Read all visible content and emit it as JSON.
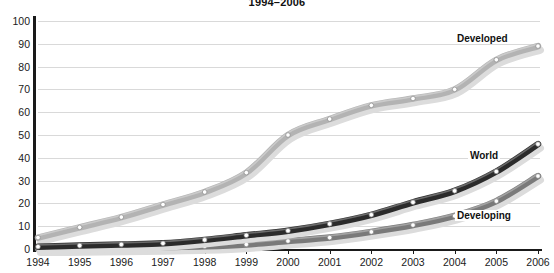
{
  "chart_title": "1994–2006",
  "axis": {
    "y_ticks": [
      0,
      10,
      20,
      30,
      40,
      50,
      60,
      70,
      80,
      90,
      100
    ],
    "x_ticks": [
      "1994",
      "1995",
      "1996",
      "1997",
      "1998",
      "1999",
      "2000",
      "2001",
      "2002",
      "2003",
      "2004",
      "2005",
      "2006"
    ]
  },
  "labels": {
    "developed": "Developed",
    "world": "World",
    "developing": "Developing"
  },
  "colors": {
    "developed": "#b3b3b3",
    "world": "#2b2b2b",
    "developing": "#7a7a7a",
    "grid": "#d9d9d9",
    "axis": "#1a1a1a",
    "marker_fill": "#ffffff"
  },
  "chart_data": {
    "type": "line",
    "title": "1994–2006",
    "xlabel": "",
    "ylabel": "",
    "ylim": [
      0,
      100
    ],
    "grid": true,
    "legend": "inline-end-labels",
    "categories": [
      "1994",
      "1995",
      "1996",
      "1997",
      "1998",
      "1999",
      "2000",
      "2001",
      "2002",
      "2003",
      "2004",
      "2005",
      "2006"
    ],
    "series": [
      {
        "name": "Developed",
        "color": "#b3b3b3",
        "values": [
          5,
          9.5,
          14,
          19.5,
          25,
          33.5,
          50,
          57,
          63,
          66,
          70,
          83,
          89
        ]
      },
      {
        "name": "World",
        "color": "#2b2b2b",
        "values": [
          1,
          1.5,
          2,
          2.5,
          4,
          6,
          8,
          11,
          15,
          20.5,
          25.5,
          34,
          46
        ]
      },
      {
        "name": "Developing",
        "color": "#7a7a7a",
        "values": [
          0.2,
          0.3,
          0.5,
          0.8,
          1.2,
          2,
          3.5,
          5,
          7.5,
          10.5,
          14.5,
          21,
          32
        ]
      }
    ]
  }
}
